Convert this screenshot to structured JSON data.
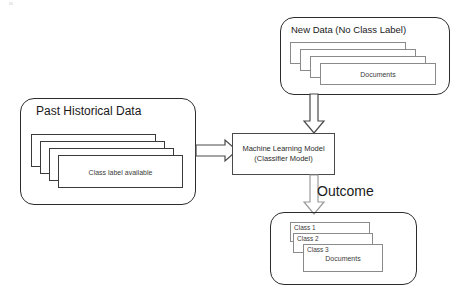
{
  "diagram": {
    "title_hidden": "Classification workflow: training data, model, new data, outcome",
    "colors": {
      "stroke_dark": "#2b2b2b",
      "stroke_mid": "#4a4a4a",
      "stroke_light": "#8a8a8a",
      "text": "#1a1a1a",
      "background": "#ffffff"
    }
  },
  "new_data_group": {
    "title": "New Data (No Class Label)",
    "cards": [
      {
        "label": ""
      },
      {
        "label": ""
      },
      {
        "label": ""
      },
      {
        "label": "Documents"
      }
    ]
  },
  "past_data_group": {
    "title": "Past Historical Data",
    "cards": [
      {
        "label": ""
      },
      {
        "label": ""
      },
      {
        "label": ""
      },
      {
        "label": "Class label available"
      }
    ]
  },
  "model_box": {
    "line1": "Machine Learning Model",
    "line2": "(Classifier Model)"
  },
  "outcome_group": {
    "label": "Outcome",
    "cards": [
      {
        "corner_label": "Class 1",
        "label": ""
      },
      {
        "corner_label": "Class 2",
        "label": ""
      },
      {
        "corner_label": "Class 3",
        "label": "Documents"
      }
    ]
  },
  "arrows": {
    "training_to_model": "arrow-right",
    "newdata_to_model": "arrow-down",
    "model_to_outcome": "arrow-down"
  }
}
